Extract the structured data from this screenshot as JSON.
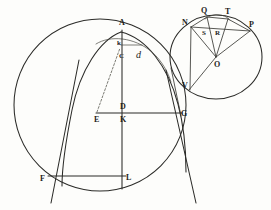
{
  "figure": {
    "background_color": "#fdfdfb",
    "ink_color": "#2b2b28",
    "width": 271,
    "height": 210
  },
  "main_diagram": {
    "name": "left-construction",
    "labels": [
      {
        "id": "A",
        "text": "A",
        "x": 121,
        "y": 24,
        "kind": "point-label"
      },
      {
        "id": "k",
        "text": "k",
        "x": 119,
        "y": 44,
        "kind": "point-label"
      },
      {
        "id": "C",
        "text": "C",
        "x": 121,
        "y": 58,
        "kind": "point-label"
      },
      {
        "id": "d",
        "text": "d",
        "x": 139,
        "y": 58,
        "kind": "script-label"
      },
      {
        "id": "D",
        "text": "D",
        "x": 122,
        "y": 108,
        "kind": "point-label"
      },
      {
        "id": "E",
        "text": "E",
        "x": 96,
        "y": 121,
        "kind": "point-label"
      },
      {
        "id": "K",
        "text": "K",
        "x": 122,
        "y": 121,
        "kind": "point-label"
      },
      {
        "id": "G",
        "text": "G",
        "x": 183,
        "y": 115,
        "kind": "point-label"
      },
      {
        "id": "F",
        "text": "F",
        "x": 42,
        "y": 180,
        "kind": "point-label"
      },
      {
        "id": "L",
        "text": "L",
        "x": 128,
        "y": 179,
        "kind": "point-label"
      }
    ]
  },
  "inset_diagram": {
    "name": "right-circle",
    "labels": [
      {
        "id": "N",
        "text": "N",
        "x": 184,
        "y": 24,
        "kind": "point-label"
      },
      {
        "id": "Q",
        "text": "Q",
        "x": 203,
        "y": 12,
        "kind": "point-label"
      },
      {
        "id": "T",
        "text": "T",
        "x": 227,
        "y": 13,
        "kind": "point-label"
      },
      {
        "id": "P",
        "text": "P",
        "x": 250,
        "y": 26,
        "kind": "point-label"
      },
      {
        "id": "S",
        "text": "S",
        "x": 203,
        "y": 34,
        "kind": "point-label"
      },
      {
        "id": "R",
        "text": "R",
        "x": 216,
        "y": 34,
        "kind": "point-label"
      },
      {
        "id": "O",
        "text": "O",
        "x": 216,
        "y": 66,
        "kind": "point-label"
      },
      {
        "id": "V",
        "text": "V",
        "x": 183,
        "y": 87,
        "kind": "point-label"
      }
    ]
  }
}
